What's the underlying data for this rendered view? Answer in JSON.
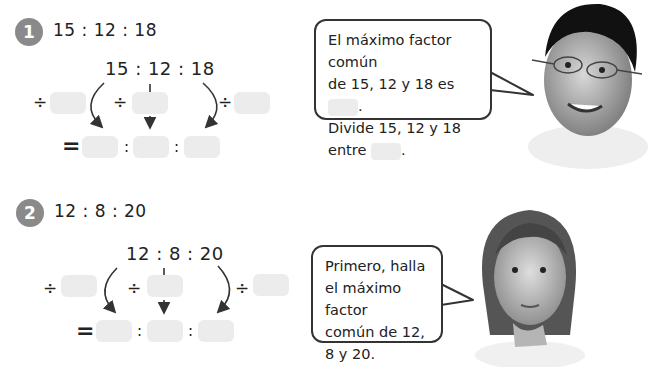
{
  "problems": [
    {
      "number": "1",
      "ratio": "15 : 12 : 18",
      "center_ratio": "15 : 12 : 18",
      "divide_symbol": "÷",
      "equals_symbol": "=",
      "colon": ":",
      "speech": {
        "line1": "El máximo factor común",
        "line2": "de 15, 12 y 18 es",
        "line2_end": ".",
        "line3": "Divide 15, 12 y 18",
        "line4": "entre",
        "line4_end": "."
      },
      "character": "boy-with-glasses"
    },
    {
      "number": "2",
      "ratio": "12 : 8 : 20",
      "center_ratio": "12 : 8 : 20",
      "divide_symbol": "÷",
      "equals_symbol": "=",
      "colon": ":",
      "speech": {
        "line1": "Primero, halla",
        "line2": "el máximo factor",
        "line3": "común de 12,",
        "line4": "8 y 20."
      },
      "character": "thinking-girl"
    }
  ],
  "colors": {
    "badge": "#8a8a8a",
    "answer_box": "#ececec",
    "text": "#222222"
  }
}
